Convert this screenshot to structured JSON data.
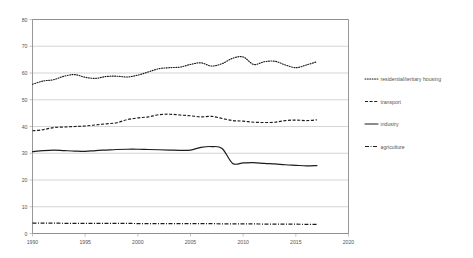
{
  "chart_data": {
    "type": "line",
    "title": "",
    "xlabel": "",
    "ylabel": "",
    "xlim": [
      1990,
      2020
    ],
    "ylim": [
      0,
      80
    ],
    "grid": true,
    "legend_position": "right",
    "x_ticks": [
      "1990",
      "1995",
      "2000",
      "2005",
      "2010",
      "2015",
      "2020"
    ],
    "y_ticks": [
      "0",
      "10",
      "20",
      "30",
      "40",
      "50",
      "60",
      "70",
      "80"
    ],
    "x": [
      1990,
      1991,
      1992,
      1993,
      1994,
      1995,
      1996,
      1997,
      1998,
      1999,
      2000,
      2001,
      2002,
      2003,
      2004,
      2005,
      2006,
      2007,
      2008,
      2009,
      2010,
      2011,
      2012,
      2013,
      2014,
      2015,
      2016,
      2017
    ],
    "series": [
      {
        "name": "residential/tertiary housing",
        "style": "dotted",
        "values": [
          55.8,
          57.0,
          57.5,
          58.8,
          59.4,
          58.4,
          58.0,
          58.7,
          58.8,
          58.5,
          59.2,
          60.4,
          61.6,
          62.0,
          62.2,
          63.2,
          63.8,
          62.6,
          63.5,
          65.5,
          66.0,
          63.2,
          64.2,
          64.4,
          63.0,
          62.0,
          63.0,
          64.2
        ]
      },
      {
        "name": "transport",
        "style": "dashed",
        "values": [
          38.4,
          38.8,
          39.6,
          39.8,
          40.0,
          40.2,
          40.6,
          41.0,
          41.4,
          42.6,
          43.2,
          43.6,
          44.4,
          44.6,
          44.3,
          44.0,
          43.6,
          43.8,
          43.0,
          42.2,
          42.0,
          41.6,
          41.5,
          41.6,
          42.2,
          42.4,
          42.2,
          42.5
        ]
      },
      {
        "name": "industry",
        "style": "solid",
        "values": [
          30.6,
          31.0,
          31.2,
          31.0,
          30.8,
          30.7,
          31.0,
          31.2,
          31.4,
          31.5,
          31.5,
          31.4,
          31.3,
          31.2,
          31.1,
          31.2,
          32.2,
          32.5,
          31.8,
          26.2,
          26.4,
          26.5,
          26.2,
          26.0,
          25.7,
          25.5,
          25.3,
          25.4
        ]
      },
      {
        "name": "agriculture",
        "style": "dash-dot",
        "values": [
          3.9,
          3.9,
          3.9,
          3.8,
          3.8,
          3.8,
          3.8,
          3.8,
          3.8,
          3.8,
          3.7,
          3.7,
          3.7,
          3.7,
          3.7,
          3.7,
          3.7,
          3.7,
          3.6,
          3.6,
          3.6,
          3.6,
          3.5,
          3.5,
          3.5,
          3.5,
          3.4,
          3.4
        ]
      }
    ]
  },
  "legend": {
    "items": [
      {
        "label": "residential/tertiary housing"
      },
      {
        "label": "transport"
      },
      {
        "label": "industry"
      },
      {
        "label": "agriculture"
      }
    ]
  },
  "colors": {
    "series": "#1c1c1c",
    "grid": "#b9b9b9",
    "frame": "#7d7d7d",
    "text": "#555555",
    "background": "#ffffff"
  }
}
